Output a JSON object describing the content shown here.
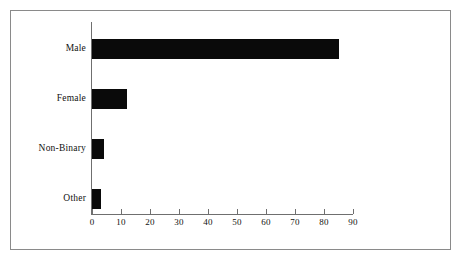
{
  "chart_data": {
    "type": "bar",
    "orientation": "horizontal",
    "title": "",
    "xlabel": "",
    "ylabel": "",
    "categories": [
      "Male",
      "Female",
      "Non-Binary",
      "Other"
    ],
    "values": [
      85,
      12,
      4,
      3
    ],
    "xlim": [
      0,
      90
    ],
    "xticks": [
      0,
      10,
      20,
      30,
      40,
      50,
      60,
      70,
      80,
      90
    ],
    "xtick_labels": [
      "0",
      "10",
      "20",
      "30",
      "40",
      "50",
      "60",
      "70",
      "80",
      "90"
    ],
    "grid": false,
    "legend": null,
    "series": [
      {
        "name": "count",
        "values": [
          85,
          12,
          4,
          3
        ]
      }
    ],
    "colors": {
      "bar": "#0a0a0a",
      "axis": "#6f6f6f",
      "border": "#8a8a8a",
      "background": "#ffffff",
      "text": "#111111"
    }
  }
}
